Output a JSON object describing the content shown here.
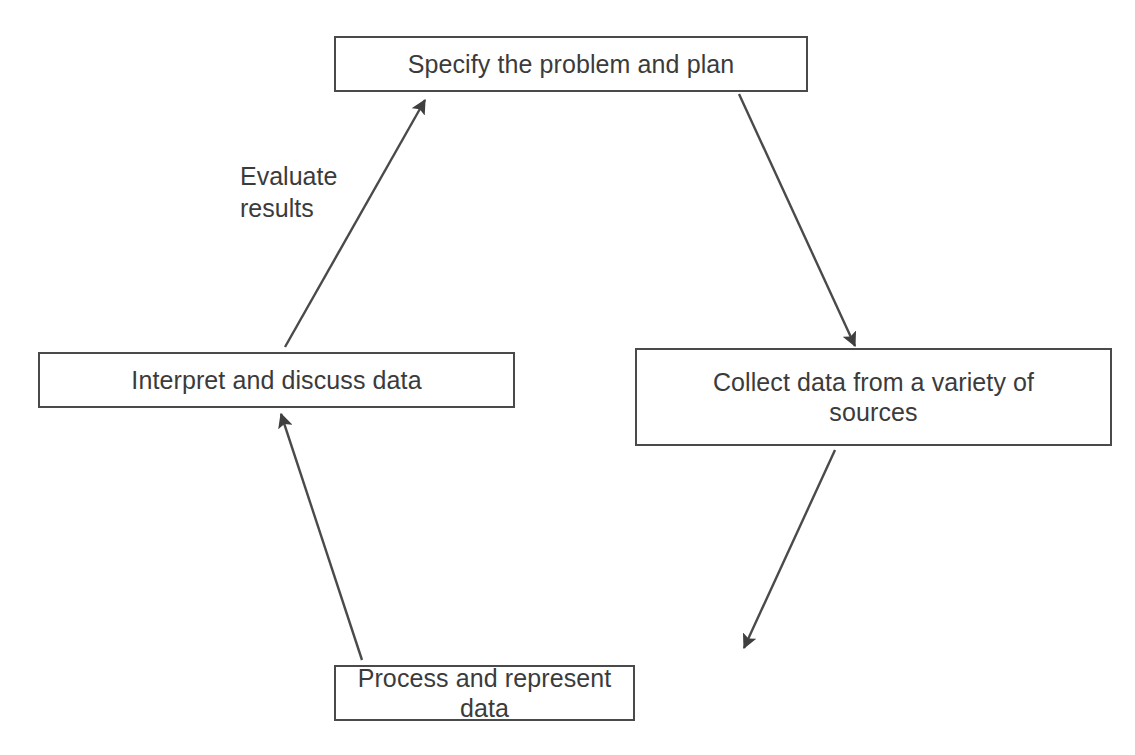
{
  "diagram": {
    "type": "cycle-flowchart",
    "direction": "clockwise",
    "background_color": "#ffffff",
    "line_color": "#4a4a4a",
    "text_color": "#3b3b3b",
    "nodes": [
      {
        "id": "specify",
        "label": "Specify the problem and plan",
        "position": "top"
      },
      {
        "id": "collect",
        "label": "Collect data from a variety of\nsources",
        "position": "right"
      },
      {
        "id": "process",
        "label": "Process and represent data",
        "position": "bottom"
      },
      {
        "id": "interpret",
        "label": "Interpret and discuss data",
        "position": "left"
      }
    ],
    "edges": [
      {
        "id": "specify-to-collect",
        "from": "specify",
        "to": "collect",
        "label": ""
      },
      {
        "id": "collect-to-process",
        "from": "collect",
        "to": "process",
        "label": ""
      },
      {
        "id": "process-to-interpret",
        "from": "process",
        "to": "interpret",
        "label": ""
      },
      {
        "id": "interpret-to-specify",
        "from": "interpret",
        "to": "specify",
        "label": "Evaluate\nresults"
      }
    ]
  }
}
